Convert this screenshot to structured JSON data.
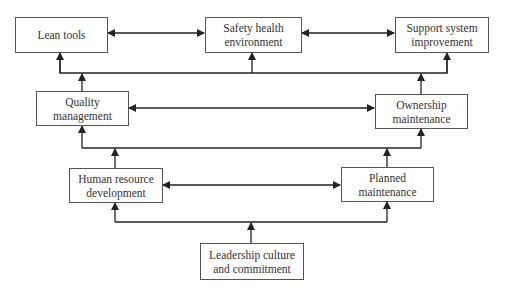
{
  "diagram": {
    "nodes": {
      "lean_tools": {
        "line1": "Lean tools",
        "line2": ""
      },
      "safety": {
        "line1": "Safety health",
        "line2": "environment"
      },
      "support": {
        "line1": "Support system",
        "line2": "improvement"
      },
      "quality": {
        "line1": "Quality",
        "line2": "management"
      },
      "ownership": {
        "line1": "Ownership",
        "line2": "maintenance"
      },
      "hrd": {
        "line1": "Human resource",
        "line2": "development"
      },
      "planned": {
        "line1": "Planned",
        "line2": "maintenance"
      },
      "leadership": {
        "line1": "Leadership culture",
        "line2": "and commitment"
      }
    },
    "edges": [
      {
        "from": "lean_tools",
        "to": "safety",
        "type": "bidirectional"
      },
      {
        "from": "safety",
        "to": "support",
        "type": "bidirectional"
      },
      {
        "from": "quality",
        "to": "ownership",
        "type": "bidirectional"
      },
      {
        "from": "hrd",
        "to": "planned",
        "type": "bidirectional"
      },
      {
        "from": "quality",
        "to": [
          "lean_tools",
          "safety",
          "support"
        ],
        "type": "bus-up"
      },
      {
        "from": "ownership",
        "to": [
          "lean_tools",
          "safety",
          "support"
        ],
        "type": "bus-up"
      },
      {
        "from": "hrd",
        "to": [
          "quality",
          "ownership"
        ],
        "type": "bus-up"
      },
      {
        "from": "planned",
        "to": [
          "quality",
          "ownership"
        ],
        "type": "bus-up"
      },
      {
        "from": "leadership",
        "to": [
          "hrd",
          "planned"
        ],
        "type": "bus-up"
      }
    ],
    "colors": {
      "line": "#222222",
      "border": "#555555",
      "text": "#333333"
    }
  }
}
